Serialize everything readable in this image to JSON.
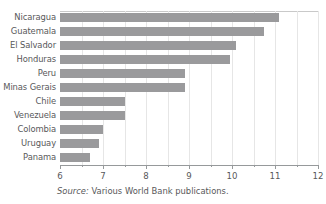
{
  "chart_data": {
    "type": "bar",
    "orientation": "horizontal",
    "title": "",
    "subtitle": "",
    "xlabel": "",
    "ylabel": "",
    "xlim": [
      6,
      12
    ],
    "categories": [
      "Nicaragua",
      "Guatemala",
      "El Salvador",
      "Honduras",
      "Peru",
      "Minas Gerais",
      "Chile",
      "Venezuela",
      "Colombia",
      "Uruguay",
      "Panama"
    ],
    "values": [
      11.1,
      10.75,
      10.1,
      9.95,
      8.9,
      8.9,
      7.5,
      7.5,
      7.0,
      6.9,
      6.7
    ],
    "series": [
      {
        "name": "value",
        "values": [
          11.1,
          10.75,
          10.1,
          9.95,
          8.9,
          8.9,
          7.5,
          7.5,
          7.0,
          6.9,
          6.7
        ]
      }
    ],
    "x_major_ticks": [
      6,
      7,
      8,
      9,
      10,
      11,
      12
    ],
    "x_major_tick_labels": [
      "6",
      "7",
      "8",
      "9",
      "10",
      "11",
      "12"
    ],
    "x_minor_ticks": [
      6.5,
      7.5,
      8.5,
      9.5,
      10.5,
      11.5
    ],
    "grid": "vertical-minor",
    "legend": "none",
    "bar_color": "#9a9a9c",
    "axis_color": "#96999b",
    "grid_color": "#e6e6e6",
    "text_color": "#58585a"
  },
  "source": {
    "prefix": "Source:",
    "text": "Various World Bank publications."
  }
}
